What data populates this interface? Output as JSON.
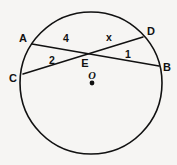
{
  "figure": {
    "background_color": "#f6f5f3",
    "stroke_color": "#111111"
  },
  "circle": {
    "center_label": "O",
    "center_x": 91,
    "center_y": 83,
    "radius": 71
  },
  "points": [
    {
      "id": "A",
      "label": "A",
      "x": 32,
      "y": 44,
      "label_x": 23,
      "label_y": 42
    },
    {
      "id": "D",
      "label": "D",
      "x": 143,
      "y": 37,
      "label_x": 147,
      "label_y": 35
    },
    {
      "id": "C",
      "label": "C",
      "x": 23,
      "y": 74,
      "label_x": 13,
      "label_y": 82
    },
    {
      "id": "B",
      "label": "B",
      "x": 159,
      "y": 66,
      "label_x": 163,
      "label_y": 71
    },
    {
      "id": "E",
      "label": "E",
      "x": 89,
      "y": 54,
      "label_x": 85,
      "label_y": 67
    },
    {
      "id": "O",
      "label": "O",
      "x": 92,
      "y": 83,
      "label_x": 89,
      "label_y": 79
    }
  ],
  "chords": [
    {
      "id": "AB",
      "from": "A",
      "to": "B"
    },
    {
      "id": "CD",
      "from": "C",
      "to": "D"
    }
  ],
  "segment_labels": [
    {
      "id": "AE",
      "text": "4",
      "x": 66,
      "y": 42
    },
    {
      "id": "ED",
      "text": "x",
      "x": 109,
      "y": 41
    },
    {
      "id": "CE",
      "text": "2",
      "x": 52,
      "y": 64
    },
    {
      "id": "EB",
      "text": "1",
      "x": 128,
      "y": 58
    }
  ]
}
